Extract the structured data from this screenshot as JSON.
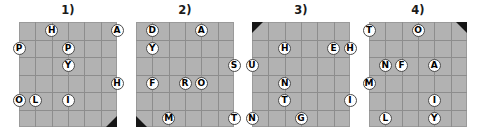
{
  "page": {
    "background_color": "#ffffff",
    "grid_fill_color": "#b2b2b2",
    "grid_line_color": "#8d8d8d",
    "marker_color": "#161616",
    "letter_bg_color": "#ffffff",
    "letter_text_color": "#000000"
  },
  "puzzles": [
    {
      "title": "1)",
      "rows": 6,
      "cols": 6,
      "corner_marker": "bottom-right",
      "letters": [
        {
          "char": "H",
          "col": 2,
          "row": 0
        },
        {
          "char": "A",
          "col": 6,
          "row": 0
        },
        {
          "char": "P",
          "col": 0,
          "row": 1
        },
        {
          "char": "P",
          "col": 3,
          "row": 1
        },
        {
          "char": "Y",
          "col": 3,
          "row": 2
        },
        {
          "char": "H",
          "col": 6,
          "row": 3
        },
        {
          "char": "O",
          "col": 0,
          "row": 4
        },
        {
          "char": "L",
          "col": 1,
          "row": 4
        },
        {
          "char": "I",
          "col": 3,
          "row": 4
        }
      ]
    },
    {
      "title": "2)",
      "rows": 6,
      "cols": 6,
      "corner_marker": "bottom-left",
      "letters": [
        {
          "char": "D",
          "col": 1,
          "row": 0
        },
        {
          "char": "A",
          "col": 4,
          "row": 0
        },
        {
          "char": "Y",
          "col": 1,
          "row": 1
        },
        {
          "char": "S",
          "col": 6,
          "row": 2
        },
        {
          "char": "F",
          "col": 1,
          "row": 3
        },
        {
          "char": "R",
          "col": 3,
          "row": 3
        },
        {
          "char": "O",
          "col": 4,
          "row": 3
        },
        {
          "char": "M",
          "col": 2,
          "row": 5
        },
        {
          "char": "T",
          "col": 6,
          "row": 5
        }
      ]
    },
    {
      "title": "3)",
      "rows": 6,
      "cols": 6,
      "corner_marker": "top-left",
      "letters": [
        {
          "char": "H",
          "col": 2,
          "row": 1
        },
        {
          "char": "E",
          "col": 5,
          "row": 1
        },
        {
          "char": "H",
          "col": 6,
          "row": 1
        },
        {
          "char": "U",
          "col": 0,
          "row": 2
        },
        {
          "char": "N",
          "col": 2,
          "row": 3
        },
        {
          "char": "T",
          "col": 2,
          "row": 4
        },
        {
          "char": "I",
          "col": 6,
          "row": 4
        },
        {
          "char": "N",
          "col": 0,
          "row": 5
        },
        {
          "char": "G",
          "col": 3,
          "row": 5
        }
      ]
    },
    {
      "title": "4)",
      "rows": 6,
      "cols": 6,
      "corner_marker": "top-right",
      "letters": [
        {
          "char": "T",
          "col": 0,
          "row": 0
        },
        {
          "char": "O",
          "col": 3,
          "row": 0
        },
        {
          "char": "N",
          "col": 1,
          "row": 2
        },
        {
          "char": "F",
          "col": 2,
          "row": 2
        },
        {
          "char": "A",
          "col": 4,
          "row": 2
        },
        {
          "char": "M",
          "col": 0,
          "row": 3
        },
        {
          "char": "I",
          "col": 4,
          "row": 4
        },
        {
          "char": "L",
          "col": 1,
          "row": 5
        },
        {
          "char": "Y",
          "col": 4,
          "row": 5
        }
      ]
    }
  ]
}
